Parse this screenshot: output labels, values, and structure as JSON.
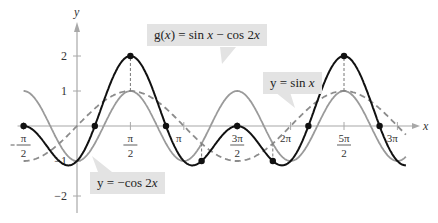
{
  "chart_data": {
    "type": "line",
    "title": "",
    "xlabel": "x",
    "ylabel": "y",
    "xlim": [
      -1.5708,
      9.4248
    ],
    "ylim": [
      -2.5,
      2.5
    ],
    "grid": false,
    "x_ticks": [
      {
        "value": -1.5708,
        "label": "−π/2"
      },
      {
        "value": 1.5708,
        "label": "π/2"
      },
      {
        "value": 3.1416,
        "label": "π"
      },
      {
        "value": 4.7124,
        "label": "3π/2"
      },
      {
        "value": 6.2832,
        "label": "2π"
      },
      {
        "value": 7.854,
        "label": "5π/2"
      },
      {
        "value": 9.4248,
        "label": "3π"
      }
    ],
    "y_ticks": [
      {
        "value": 2,
        "label": "2"
      },
      {
        "value": 1,
        "label": "1"
      },
      {
        "value": -1,
        "label": "−1"
      },
      {
        "value": -2,
        "label": "−2"
      }
    ],
    "series": [
      {
        "name": "g(x) = sin x − cos 2x",
        "expr": "sin(x) - cos(2x)",
        "style": "solid",
        "color": "#111111"
      },
      {
        "name": "y = sin x",
        "expr": "sin(x)",
        "style": "dashed",
        "color": "#8c8c8c"
      },
      {
        "name": "y = −cos 2x",
        "expr": "-cos(2x)",
        "style": "solid",
        "color": "#9a9a9a"
      }
    ],
    "marked_points": [
      {
        "x": -1.5708,
        "y": 0
      },
      {
        "x": 0.5236,
        "y": 0
      },
      {
        "x": 1.5708,
        "y": 2
      },
      {
        "x": 2.618,
        "y": 0
      },
      {
        "x": 3.6652,
        "y": -1
      },
      {
        "x": 4.7124,
        "y": 0
      },
      {
        "x": 5.7596,
        "y": -1
      },
      {
        "x": 6.8068,
        "y": 0
      },
      {
        "x": 7.854,
        "y": 2
      },
      {
        "x": 8.9012,
        "y": 0
      }
    ],
    "annotations": [
      {
        "text": "g(x) = sin x − cos 2x"
      },
      {
        "text": "y = sin x"
      },
      {
        "text": "y = −cos 2x"
      }
    ]
  },
  "labels": {
    "g": {
      "pre": "g(",
      "var": "x",
      "mid": ") = sin ",
      "var2": "x",
      "post": " − cos 2",
      "var3": "x"
    },
    "sin": {
      "pre": "y = sin ",
      "var": "x"
    },
    "cos": {
      "pre": "y = −cos 2",
      "var": "x"
    }
  }
}
